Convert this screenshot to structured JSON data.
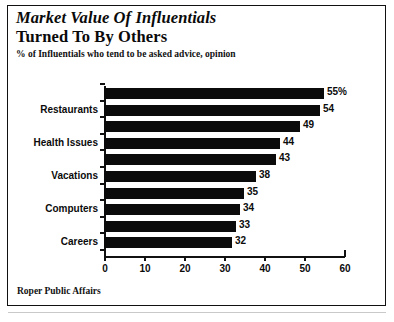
{
  "header": {
    "title_line1": "Market Value Of Influentials",
    "title_line2": "Turned To By Others",
    "subtitle": "% of Influentials who tend to be asked advice, opinion"
  },
  "footer": {
    "source": "Roper Public Affairs"
  },
  "chart_data": {
    "type": "bar",
    "orientation": "horizontal",
    "title": "Market Value Of Influentials Turned To By Others",
    "subtitle": "% of Influentials who tend to be asked advice, opinion",
    "xlabel": "",
    "ylabel": "",
    "xlim": [
      0,
      60
    ],
    "xticks": [
      0,
      10,
      20,
      30,
      40,
      50,
      60
    ],
    "xtick_labels": [
      "0",
      "10",
      "20",
      "30",
      "40",
      "50",
      "60"
    ],
    "grid": false,
    "legend": false,
    "bar_color": "#0b0b0b",
    "categories": [
      "",
      "Restaurants",
      "",
      "Health Issues",
      "",
      "Vacations",
      "",
      "Computers",
      "",
      "Careers"
    ],
    "visible_category_labels": [
      "Restaurants",
      "Health Issues",
      "Vacations",
      "Computers",
      "Careers"
    ],
    "values": [
      55,
      54,
      49,
      44,
      43,
      38,
      35,
      34,
      33,
      32
    ],
    "value_labels": [
      "55%",
      "54",
      "49",
      "44",
      "43",
      "38",
      "35",
      "34",
      "33",
      "32"
    ],
    "bars": [
      {
        "label": "",
        "value": 55,
        "value_label": "55%"
      },
      {
        "label": "Restaurants",
        "value": 54,
        "value_label": "54"
      },
      {
        "label": "",
        "value": 49,
        "value_label": "49"
      },
      {
        "label": "Health Issues",
        "value": 44,
        "value_label": "44"
      },
      {
        "label": "",
        "value": 43,
        "value_label": "43"
      },
      {
        "label": "Vacations",
        "value": 38,
        "value_label": "38"
      },
      {
        "label": "",
        "value": 35,
        "value_label": "35"
      },
      {
        "label": "Computers",
        "value": 34,
        "value_label": "34"
      },
      {
        "label": "",
        "value": 33,
        "value_label": "33"
      },
      {
        "label": "Careers",
        "value": 32,
        "value_label": "32"
      }
    ]
  }
}
